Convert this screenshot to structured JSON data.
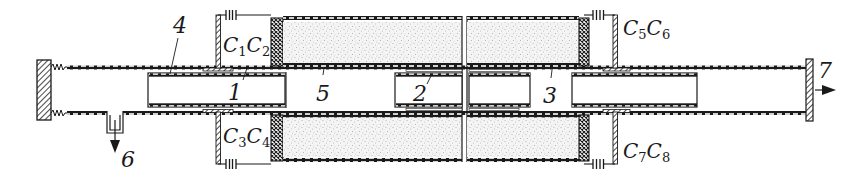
{
  "diagram": {
    "type": "technical cross-section schematic",
    "colors": {
      "ink": "#1a1a1a",
      "paper": "#ffffff",
      "stipple": "#d9d9d9"
    },
    "labels": {
      "part1": "1",
      "part2": "2",
      "part3": "3",
      "part4": "4",
      "part5": "5",
      "outlet6": "6",
      "outlet7": "7"
    },
    "capacitors": {
      "c1": {
        "letter": "C",
        "sub": "1"
      },
      "c2": {
        "letter": "C",
        "sub": "2"
      },
      "c3": {
        "letter": "C",
        "sub": "3"
      },
      "c4": {
        "letter": "C",
        "sub": "4"
      },
      "c5": {
        "letter": "C",
        "sub": "5"
      },
      "c6": {
        "letter": "C",
        "sub": "6"
      },
      "c7": {
        "letter": "C",
        "sub": "7"
      },
      "c8": {
        "letter": "C",
        "sub": "8"
      }
    },
    "icons": {
      "outlet6_arrow": "arrow-down-icon",
      "outlet7_arrow": "arrow-right-icon",
      "capacitor_symbol": "capacitor-icon",
      "spring_symbol": "spring-icon"
    }
  }
}
